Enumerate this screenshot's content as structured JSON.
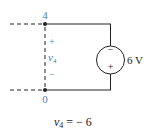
{
  "diagram": {
    "type": "circuit",
    "nodes": [
      {
        "id": "4",
        "label": "4"
      },
      {
        "id": "0",
        "label": "0"
      }
    ],
    "voltage_measurement": {
      "plus": "+",
      "minus": "−",
      "variable": "v",
      "subscript": "4"
    },
    "source": {
      "type": "voltage-source",
      "top_sign": "−",
      "bottom_sign": "+",
      "label": "6 V"
    },
    "equation": {
      "variable": "v",
      "subscript": "4",
      "rhs": " = − 6"
    },
    "colors": {
      "wire": "#222222",
      "annotation": "#4a7fb5"
    }
  }
}
